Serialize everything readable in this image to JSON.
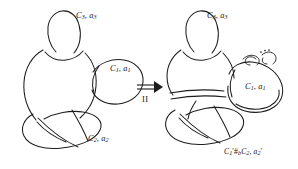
{
  "figure": {
    "background_color": "#ffffff",
    "stroke_color": "#1d1d1d",
    "width": 298,
    "height": 169
  },
  "left_diagram": {
    "name": "before-move",
    "labels": {
      "c3": {
        "base": "C",
        "sub": "3",
        "sep": ", ",
        "base2": "a",
        "sub2": "3"
      },
      "c1": {
        "base": "C",
        "sub": "1",
        "sep": ", ",
        "base2": "a",
        "sub2": "1"
      },
      "c2": {
        "base": "C",
        "sub": "2",
        "sep": ", ",
        "base2": "a",
        "sub2": "2"
      }
    },
    "label_text": {
      "c3": "C3, a3",
      "c1": "C1, a1",
      "c2": "C2, a2"
    }
  },
  "right_diagram": {
    "name": "after-move",
    "labels": {
      "c3": {
        "base": "C",
        "sub": "3",
        "sep": ", ",
        "base2": "a",
        "sub2": "3"
      },
      "c1": {
        "base": "C",
        "sub": "1",
        "sep": ", ",
        "base2": "a",
        "sub2": "1"
      },
      "sum": {
        "first_base": "C",
        "first_sub": "1",
        "first_prime": "′",
        "connect_sum": "#",
        "connect_sub": "b",
        "second_base": "C",
        "second_sub": "2",
        "sep": ", ",
        "third_base": "a",
        "third_sub": "2",
        "third_prime": "′"
      }
    },
    "label_text": {
      "c3": "C3, a3",
      "c1": "C1, a1",
      "sum": "C1' #b C2, a2'"
    },
    "twist_marker": {
      "name": "twist-ellipsis",
      "dots": 3,
      "meaning": "repeated-twists"
    }
  },
  "transformation": {
    "arrow_symbol": "⟹",
    "move_label": "II",
    "description": "double-arrow labelled II"
  }
}
